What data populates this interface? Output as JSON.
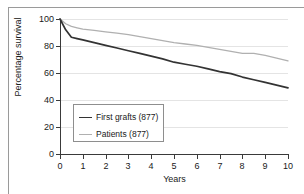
{
  "chart_data": {
    "type": "line",
    "title": "",
    "subtitle": "",
    "xlabel": "Years",
    "ylabel": "Percentage survival",
    "xlim": [
      0,
      10
    ],
    "ylim": [
      0,
      100
    ],
    "xticks": [
      "0",
      "1",
      "2",
      "3",
      "4",
      "5",
      "6",
      "7",
      "8",
      "9",
      "10"
    ],
    "yticks": [
      "0",
      "20",
      "40",
      "60",
      "80",
      "100"
    ],
    "grid": "horizontal",
    "legend_position": "inside-lower-left",
    "series": [
      {
        "name": "First grafts (877)",
        "color": "#333333",
        "x": [
          0,
          0.25,
          0.5,
          0.75,
          1,
          1.5,
          2,
          2.5,
          3,
          3.5,
          4,
          4.5,
          5,
          5.5,
          6,
          6.5,
          7,
          7.5,
          8,
          8.5,
          9,
          9.5,
          10
        ],
        "values": [
          100,
          92,
          86.5,
          85.5,
          84.5,
          82.5,
          80.5,
          78.5,
          76.5,
          74.5,
          72.5,
          70.5,
          68,
          66.5,
          65,
          63,
          61,
          59.5,
          57,
          55,
          53,
          51,
          49
        ]
      },
      {
        "name": "Patients (877)",
        "color": "#b0b0b0",
        "x": [
          0,
          0.25,
          0.5,
          0.75,
          1,
          1.5,
          2,
          2.5,
          3,
          3.5,
          4,
          4.5,
          5,
          5.5,
          6,
          6.5,
          7,
          7.5,
          8,
          8.5,
          9,
          9.5,
          10
        ],
        "values": [
          100,
          96.5,
          94.5,
          93.5,
          92.5,
          91.5,
          90.5,
          89.5,
          88.5,
          87,
          85.5,
          84,
          82.5,
          81.5,
          80.5,
          79,
          77.5,
          76,
          74.5,
          74.5,
          73,
          71,
          69
        ]
      }
    ]
  },
  "legend": {
    "items": [
      {
        "label": "First grafts (877)",
        "color": "#333333"
      },
      {
        "label": "Patients (877)",
        "color": "#b0b0b0"
      }
    ]
  }
}
